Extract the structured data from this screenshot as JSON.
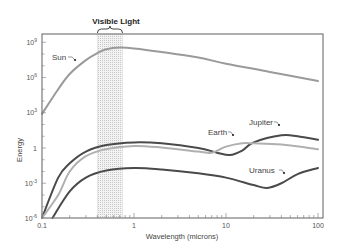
{
  "chart_data": {
    "type": "line",
    "title": "",
    "xlabel": "Wavelength (microns)",
    "ylabel": "Energy",
    "xscale": "log",
    "yscale": "log",
    "xlim": [
      0.1,
      100
    ],
    "ylim": [
      1e-06,
      1000000000.0
    ],
    "x_ticks": [
      {
        "value": 0.1,
        "label": "0.1"
      },
      {
        "value": 1,
        "label": "1"
      },
      {
        "value": 10,
        "label": "10"
      },
      {
        "value": 100,
        "label": "100"
      }
    ],
    "y_ticks": [
      {
        "value": 1000000000.0,
        "base": "10",
        "exp": "9"
      },
      {
        "value": 1000000.0,
        "base": "10",
        "exp": "6"
      },
      {
        "value": 1000.0,
        "base": "10",
        "exp": "3"
      },
      {
        "value": 1,
        "base": "1",
        "exp": ""
      },
      {
        "value": 0.001,
        "base": "10",
        "exp": "-3"
      },
      {
        "value": 1e-06,
        "base": "10",
        "exp": "-6"
      }
    ],
    "grid": false,
    "legend": "inline labels",
    "shaded_region": {
      "label": "Visible Light",
      "x_start": 0.4,
      "x_end": 0.75
    },
    "series": [
      {
        "name": "Sun",
        "color": "#9a9a9a",
        "points": [
          [
            0.1,
            800
          ],
          [
            0.15,
            100000.0
          ],
          [
            0.2,
            2000000.0
          ],
          [
            0.3,
            30000000.0
          ],
          [
            0.4,
            120000000.0
          ],
          [
            0.5,
            250000000.0
          ],
          [
            0.7,
            350000000.0
          ],
          [
            1,
            300000000.0
          ],
          [
            2,
            150000000.0
          ],
          [
            5,
            50000000.0
          ],
          [
            10,
            15000000.0
          ],
          [
            30,
            3000000.0
          ],
          [
            100,
            500000.0
          ]
        ]
      },
      {
        "name": "Jupiter",
        "color": "#4a4a4a",
        "points": [
          [
            0.1,
            1e-06
          ],
          [
            0.15,
            0.003
          ],
          [
            0.2,
            0.05
          ],
          [
            0.3,
            0.5
          ],
          [
            0.5,
            1.8
          ],
          [
            1,
            3
          ],
          [
            2,
            2.5
          ],
          [
            5,
            1
          ],
          [
            8,
            0.4
          ],
          [
            11,
            0.25
          ],
          [
            15,
            0.6
          ],
          [
            20,
            3
          ],
          [
            40,
            12
          ],
          [
            60,
            10
          ],
          [
            100,
            5
          ]
        ]
      },
      {
        "name": "Earth",
        "color": "#b0b0b0",
        "points": [
          [
            0.1,
            1e-06
          ],
          [
            0.15,
            0.0001
          ],
          [
            0.2,
            0.01
          ],
          [
            0.3,
            0.2
          ],
          [
            0.5,
            0.8
          ],
          [
            1,
            1.5
          ],
          [
            2,
            1.1
          ],
          [
            5,
            0.5
          ],
          [
            7,
            0.4
          ],
          [
            10,
            1.3
          ],
          [
            15,
            2.5
          ],
          [
            20,
            2.5
          ],
          [
            40,
            2
          ],
          [
            100,
            0.8
          ]
        ]
      },
      {
        "name": "Uranus",
        "color": "#4a4a4a",
        "points": [
          [
            0.13,
            1e-06
          ],
          [
            0.2,
            0.0002
          ],
          [
            0.3,
            0.003
          ],
          [
            0.5,
            0.012
          ],
          [
            1,
            0.02
          ],
          [
            2,
            0.015
          ],
          [
            5,
            0.007
          ],
          [
            10,
            0.003
          ],
          [
            20,
            0.0007
          ],
          [
            28,
            0.0004
          ],
          [
            40,
            0.001
          ],
          [
            60,
            0.006
          ],
          [
            100,
            0.02
          ]
        ]
      }
    ]
  },
  "annotations": {
    "visible_light": "Visible Light",
    "sun": "Sun",
    "jupiter": "Jupiter",
    "earth": "Earth",
    "uranus": "Uranus"
  }
}
